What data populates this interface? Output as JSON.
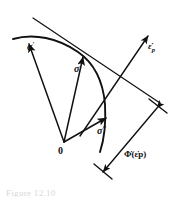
{
  "figure": {
    "domain": "Diagram",
    "background_color": "#ffffff",
    "ink_color": "#111111",
    "width": 173,
    "height": 200
  },
  "labels": {
    "sigma_prime": {
      "base": "σ",
      "superscript": "′",
      "full": "σ′",
      "role": "admissible-stress-vector"
    },
    "sigma": {
      "base": "σ",
      "superscript": "",
      "full": "σ",
      "role": "stress-on-yield-surface"
    },
    "sigma_star": {
      "base": "σ",
      "superscript": "*",
      "full": "σ*",
      "role": "second-admissible-stress-vector"
    },
    "origin": {
      "full": "0",
      "role": "origin-of-stress-space"
    },
    "strain_rate": {
      "base": "ε",
      "dot": "̇",
      "subscript": "p",
      "full": "ε̇p",
      "role": "plastic-strain-rate-vector"
    },
    "dissipation": {
      "base": "Φ",
      "dot": "̇",
      "argument": "(ε̇p)",
      "full": "Φ̇(ε̇p)",
      "role": "dissipation-function-distance"
    }
  },
  "caption": {
    "text": "Figure 12.10"
  },
  "geometry": {
    "origin_point": [
      64,
      142
    ],
    "yield_curve": "convex arc from upper-left to lower-right",
    "tangent_line": "supporting hyperplane normal to strain rate vector",
    "measurement": "perpendicular distance from origin to supporting line"
  }
}
